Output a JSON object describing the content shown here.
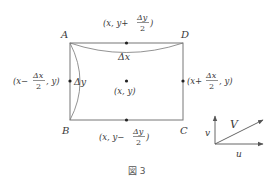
{
  "figure": {
    "caption": "図 3",
    "colors": {
      "line": "#666666",
      "text": "#3a3a3a",
      "point": "#222222"
    },
    "corners": {
      "A": "A",
      "B": "B",
      "C": "C",
      "D": "D"
    },
    "center_label": "(x, y)",
    "delta_x_label": "Δx",
    "delta_y_label": "Δy",
    "top_mid": {
      "prefix": "(x, y+",
      "num": "Δy",
      "den": "2",
      "suffix": ")"
    },
    "bottom_mid": {
      "prefix": "(x, y−",
      "num": "Δy",
      "den": "2",
      "suffix": ")"
    },
    "left_mid": {
      "prefix": "(x−",
      "num": "Δx",
      "den": "2",
      "suffix": ", y)"
    },
    "right_mid": {
      "prefix": "(x+",
      "num": "Δx",
      "den": "2",
      "suffix": ", y)"
    },
    "vector": {
      "V": "V",
      "u": "u",
      "v": "v"
    }
  }
}
